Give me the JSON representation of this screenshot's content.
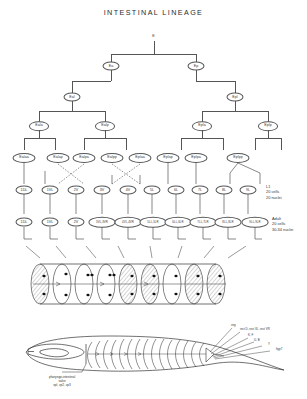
{
  "figure": {
    "title": "INTESTINAL LINEAGE"
  },
  "lineage": {
    "generations": [
      {
        "level": 0,
        "nodes": [
          {
            "label": "E"
          }
        ]
      },
      {
        "level": 1,
        "nodes": [
          {
            "label": "Ea"
          },
          {
            "label": "Ep"
          }
        ]
      },
      {
        "level": 2,
        "nodes": [
          {
            "label": "Eal"
          },
          {
            "label": "Epl"
          }
        ]
      },
      {
        "level": 3,
        "nodes": [
          {
            "label": "Eala"
          },
          {
            "label": "Ealp"
          },
          {
            "label": "Epla"
          },
          {
            "label": "Eplp"
          }
        ]
      },
      {
        "level": 4,
        "nodes": [
          {
            "label": "Ealaa"
          },
          {
            "label": "Ealap"
          },
          {
            "label": "Ealpa"
          },
          {
            "label": "Ealpp"
          },
          {
            "label": "Eplaa"
          },
          {
            "label": "Eplap"
          },
          {
            "label": "Eplpa"
          },
          {
            "label": "Eplpp"
          }
        ]
      }
    ],
    "l1_row": {
      "cells": [
        "1DL",
        "1VL",
        "2V",
        "3V",
        "4V",
        "5L",
        "6L",
        "7L",
        "8L",
        "9L"
      ],
      "stage_label": "L1",
      "cell_count": "20 cells",
      "nuclei_count": "20 nuclei"
    },
    "adult_row": {
      "cells": [
        "1DL",
        "1VL",
        "2V",
        "3VL,3VR",
        "4VL,4VR",
        "5LL,5LR",
        "6LL,6LR",
        "7LL,7LR",
        "8LL,8LR",
        "9LL,9LR"
      ],
      "stage_label": "Adult",
      "cell_count": "20 cells",
      "nuclei_count": "30-34 nuclei"
    }
  },
  "intestine_diagram": {
    "name": "intestinal-ring-cylinder",
    "ring_count": 9,
    "description": "cut-away cylinder of stacked intestinal rings with nuclei"
  },
  "worm_diagram": {
    "name": "nematode-body-outline",
    "ventral_label_line1": "pharyngo-intestinal",
    "ventral_label_line2": "valve",
    "ventral_label_line3": "vpl, vp2, vp3",
    "posterior_labels": [
      "virg",
      "rect D, rect VL, rect VR",
      "K, F",
      "U, B",
      "Y",
      "hyp7"
    ]
  },
  "colors": {
    "ink": "#1a1a1a",
    "line": "#555555",
    "paper": "#ffffff"
  }
}
